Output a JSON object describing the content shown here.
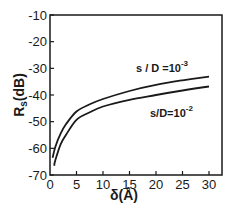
{
  "chart_data": {
    "type": "line",
    "title": "",
    "xlabel": "δ(Å)",
    "ylabel": "Rs(dB)",
    "ylabel_main": "R",
    "ylabel_sub": "s",
    "ylabel_unit": "(dB)",
    "xlim": [
      0,
      32
    ],
    "ylim": [
      -70,
      -10
    ],
    "grid": false,
    "legend_position": "inline annotations",
    "x_ticks": [
      0,
      5,
      10,
      15,
      20,
      25,
      30
    ],
    "x_tick_labels": [
      "0",
      "5",
      "10",
      "15",
      "20",
      "25",
      "30"
    ],
    "y_ticks": [
      -10,
      -20,
      -30,
      -40,
      -50,
      -60,
      -70
    ],
    "y_tick_labels": [
      "-10",
      "-20",
      "-30",
      "-40",
      "-50",
      "-60",
      "-70"
    ],
    "series": [
      {
        "name": "s/D=10^-3",
        "label_base": "s / D =10",
        "label_exp": "-3",
        "x": [
          0.5,
          1,
          2,
          3,
          5,
          7.5,
          10,
          15,
          20,
          25,
          30
        ],
        "values": [
          -63.5,
          -59.5,
          -54.5,
          -51,
          -46.2,
          -43.5,
          -41.5,
          -38.5,
          -36.2,
          -34.5,
          -33.1
        ]
      },
      {
        "name": "s/D=10^-2",
        "label_base": "s/D=10",
        "label_exp": "-2",
        "x": [
          0.8,
          1,
          2,
          3,
          5,
          7.5,
          10,
          15,
          20,
          25,
          30
        ],
        "values": [
          -66.5,
          -64.5,
          -58.5,
          -55,
          -49.3,
          -46.5,
          -44.3,
          -41.8,
          -40.0,
          -38.3,
          -36.8
        ]
      }
    ]
  }
}
